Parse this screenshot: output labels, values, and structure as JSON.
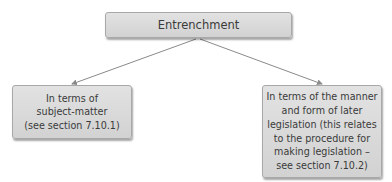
{
  "diagram": {
    "root": {
      "label": "Entrenchment"
    },
    "children": [
      {
        "label": "In terms of\nsubject-matter\n(see section 7.10.1)"
      },
      {
        "label": "In terms of the manner\nand form of later\nlegislation (this relates\nto the procedure for\nmaking legislation –\nsee section 7.10.2)"
      }
    ],
    "edges": [
      {
        "from": "root",
        "to": "children.0"
      },
      {
        "from": "root",
        "to": "children.1"
      }
    ],
    "colors": {
      "box_fill": "#d9d9d9",
      "box_border": "#a8a8a8",
      "line": "#8a8a8a",
      "text": "#3a3a3a"
    }
  }
}
